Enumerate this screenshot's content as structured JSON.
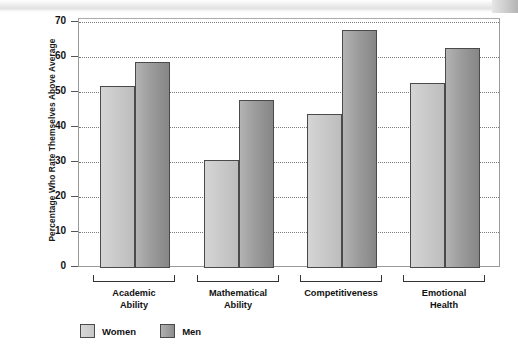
{
  "chart_data": {
    "type": "bar",
    "title": "",
    "xlabel": "",
    "ylabel": "Percentage Who Rate Themselves Above Average",
    "ylim": [
      0,
      70
    ],
    "ytick_labels": [
      "0",
      "10",
      "20",
      "30",
      "40",
      "50",
      "60",
      "70"
    ],
    "ytick_values": [
      0,
      10,
      20,
      30,
      40,
      50,
      60,
      70
    ],
    "grid": "horizontal-dotted",
    "legend_position": "bottom-left",
    "categories": [
      "Academic Ability",
      "Mathematical Ability",
      "Competitiveness",
      "Emotional Health"
    ],
    "category_lines": [
      [
        "Academic",
        "Ability"
      ],
      [
        "Mathematical",
        "Ability"
      ],
      [
        "Competitiveness",
        ""
      ],
      [
        "Emotional",
        "Health"
      ]
    ],
    "series": [
      {
        "name": "Women",
        "color": "#cacaca",
        "values": [
          52,
          31,
          44,
          53
        ]
      },
      {
        "name": "Men",
        "color": "#9c9c9c",
        "values": [
          59,
          48,
          68,
          63
        ]
      }
    ]
  },
  "legend": {
    "items": [
      {
        "label": "Women",
        "swatch": "women"
      },
      {
        "label": "Men",
        "swatch": "men"
      }
    ]
  }
}
